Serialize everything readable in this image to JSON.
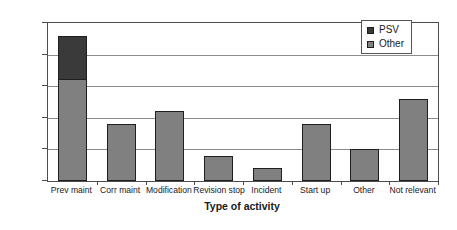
{
  "chart_data": {
    "type": "bar",
    "stacked": true,
    "title": "",
    "xlabel": "Type of activity",
    "ylabel": "NUmber of leaks > 0.1 kg/s",
    "categories": [
      "Prev maint",
      "Corr maint",
      "Modification",
      "Revision stop",
      "Incident",
      "Start up",
      "Other",
      "Not relevant"
    ],
    "series": [
      {
        "name": "Other",
        "color": "#808080",
        "values": [
          16,
          9,
          11,
          4,
          2,
          9,
          5,
          13
        ]
      },
      {
        "name": "PSV",
        "color": "#3a3a3a",
        "values": [
          7,
          0,
          0,
          0,
          0,
          0,
          0,
          0
        ]
      }
    ],
    "totals": [
      23,
      9,
      11,
      4,
      2,
      9,
      5,
      13
    ],
    "ylim": [
      0,
      25
    ],
    "yticks": [
      0,
      5,
      10,
      15,
      20,
      25
    ],
    "ytick_labels": [
      "0",
      "5",
      "10",
      "15",
      "20",
      "25"
    ],
    "grid": true,
    "grid_axis": "y",
    "legend_position": "top-right",
    "legend_entries": [
      {
        "label": "PSV",
        "color": "#3a3a3a"
      },
      {
        "label": "Other",
        "color": "#808080"
      }
    ]
  },
  "axes": {
    "frame_color": "#4d4d4d",
    "gridline_color": "#8c8c8c",
    "background": "#ffffff"
  }
}
